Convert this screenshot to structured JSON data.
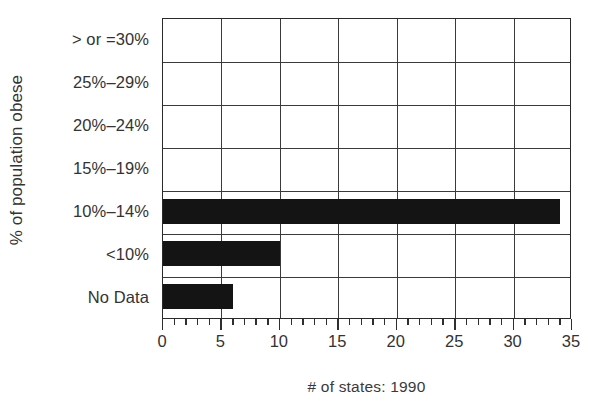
{
  "chart_data": {
    "type": "bar",
    "orientation": "horizontal",
    "title": "",
    "xlabel": "# of states: 1990",
    "ylabel": "% of population obese",
    "categories": [
      "> or =30%",
      "25%–29%",
      "20%–24%",
      "15%–19%",
      "10%–14%",
      "<10%",
      "No Data"
    ],
    "values": [
      0,
      0,
      0,
      0,
      34,
      10,
      6
    ],
    "xlim": [
      0,
      35
    ],
    "xticks": [
      0,
      5,
      10,
      15,
      20,
      25,
      30,
      35
    ],
    "xtick_labels": [
      "0",
      "5",
      "10",
      "15",
      "20",
      "25",
      "30",
      "35"
    ],
    "minor_tick_step": 1,
    "grid": "both",
    "legend": "none",
    "bar_color": "#141414",
    "axis_color": "#2a2a2a",
    "background": "#ffffff"
  }
}
